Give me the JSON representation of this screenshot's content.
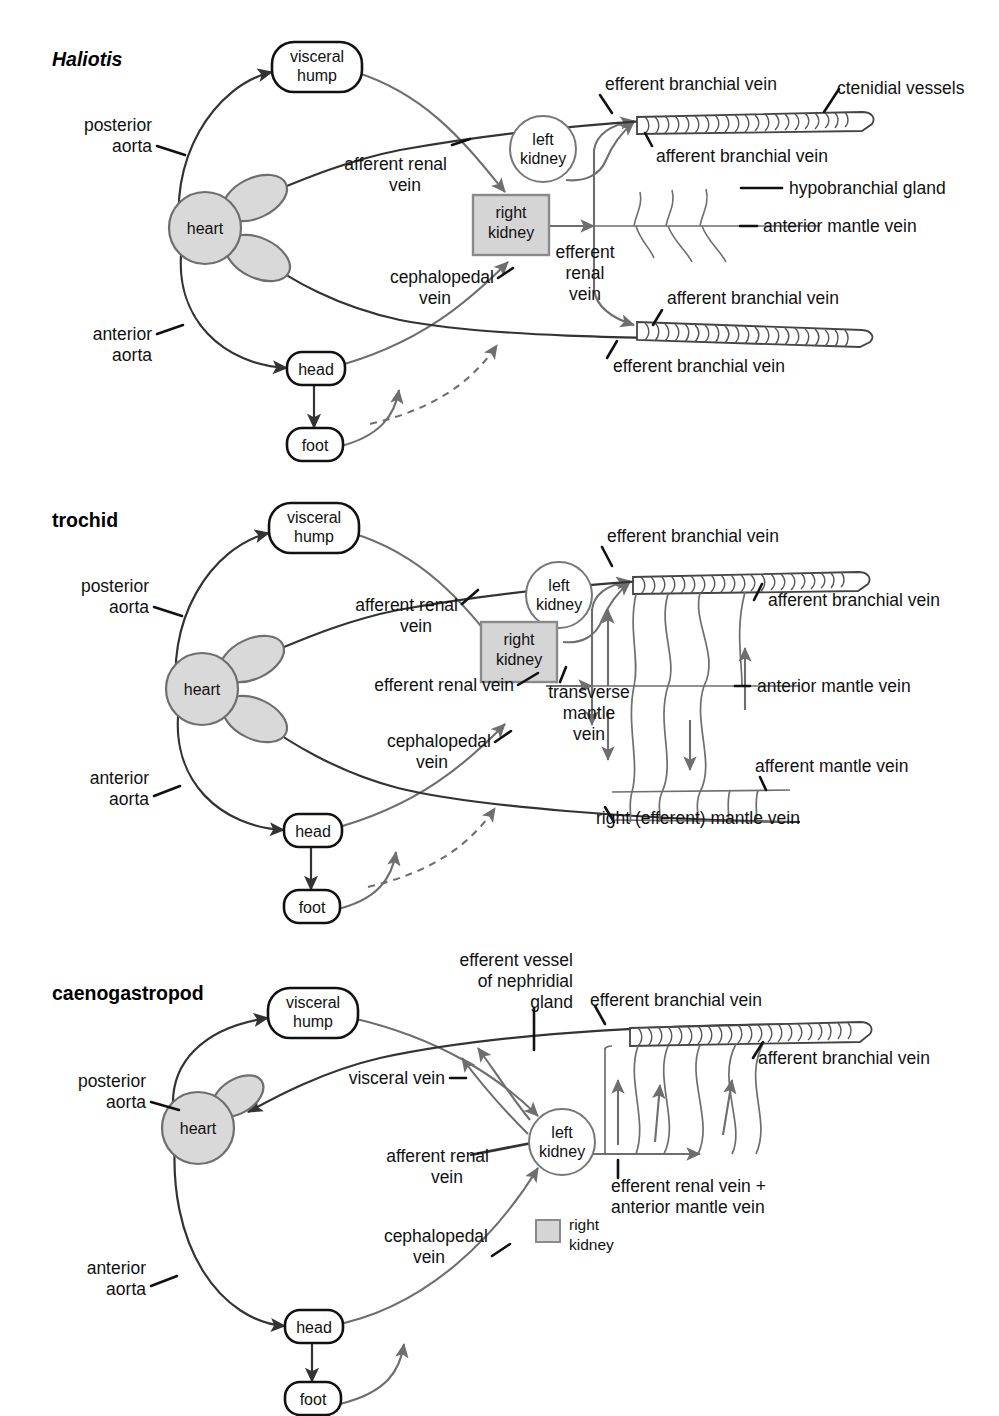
{
  "figure": {
    "kind": "comparative-anatomy-diagram",
    "background_color": "#ffffff",
    "ink_color": "#333333",
    "vessel_color": "#6e6e6e",
    "organ_fill": "#d9d9d9",
    "box_fill": "#d5d5d5"
  },
  "panels": [
    {
      "id": "haliotis",
      "title": "Haliotis",
      "title_italic": true,
      "nodes": [
        {
          "name": "visceral-hump",
          "label_line1": "visceral",
          "label_line2": "hump",
          "shape": "rounded-rect"
        },
        {
          "name": "heart",
          "label": "heart",
          "shape": "heart-two-auricles"
        },
        {
          "name": "head",
          "label": "head",
          "shape": "rounded-rect"
        },
        {
          "name": "foot",
          "label": "foot",
          "shape": "rounded-rect"
        },
        {
          "name": "left-kidney",
          "label_line1": "left",
          "label_line2": "kidney",
          "shape": "circle"
        },
        {
          "name": "right-kidney",
          "label_line1": "right",
          "label_line2": "kidney",
          "shape": "shaded-square"
        }
      ],
      "labels": [
        {
          "name": "posterior-aorta",
          "line1": "posterior",
          "line2": "aorta"
        },
        {
          "name": "anterior-aorta",
          "line1": "anterior",
          "line2": "aorta"
        },
        {
          "name": "afferent-renal-vein",
          "line1": "afferent renal",
          "line2": "vein"
        },
        {
          "name": "cephalopedal-vein",
          "line1": "cephalopedal",
          "line2": "vein"
        },
        {
          "name": "efferent-renal-vein",
          "line1": "efferent",
          "line2": "renal",
          "line3": "vein"
        },
        {
          "name": "efferent-branchial-vein-top",
          "line1": "efferent branchial vein"
        },
        {
          "name": "efferent-branchial-vein-bottom",
          "line1": "efferent branchial vein"
        },
        {
          "name": "afferent-branchial-vein-top",
          "line1": "afferent branchial vein"
        },
        {
          "name": "afferent-branchial-vein-bottom",
          "line1": "afferent branchial vein"
        },
        {
          "name": "ctenidial-vessels",
          "line1": "ctenidial vessels"
        },
        {
          "name": "hypobranchial-gland",
          "line1": "hypobranchial gland"
        },
        {
          "name": "anterior-mantle-vein",
          "line1": "anterior mantle vein"
        }
      ]
    },
    {
      "id": "trochid",
      "title": "trochid",
      "title_italic": false,
      "nodes": [
        {
          "name": "visceral-hump",
          "label_line1": "visceral",
          "label_line2": "hump",
          "shape": "rounded-rect"
        },
        {
          "name": "heart",
          "label": "heart",
          "shape": "heart-two-auricles"
        },
        {
          "name": "head",
          "label": "head",
          "shape": "rounded-rect"
        },
        {
          "name": "foot",
          "label": "foot",
          "shape": "rounded-rect"
        },
        {
          "name": "left-kidney",
          "label_line1": "left",
          "label_line2": "kidney",
          "shape": "circle"
        },
        {
          "name": "right-kidney",
          "label_line1": "right",
          "label_line2": "kidney",
          "shape": "shaded-square"
        }
      ],
      "labels": [
        {
          "name": "posterior-aorta",
          "line1": "posterior",
          "line2": "aorta"
        },
        {
          "name": "anterior-aorta",
          "line1": "anterior",
          "line2": "aorta"
        },
        {
          "name": "afferent-renal-vein",
          "line1": "afferent renal",
          "line2": "vein"
        },
        {
          "name": "efferent-renal-vein",
          "line1": "efferent renal vein"
        },
        {
          "name": "cephalopedal-vein",
          "line1": "cephalopedal",
          "line2": "vein"
        },
        {
          "name": "transverse-mantle-vein",
          "line1": "transverse",
          "line2": "mantle",
          "line3": "vein"
        },
        {
          "name": "efferent-branchial-vein",
          "line1": "efferent branchial vein"
        },
        {
          "name": "afferent-branchial-vein",
          "line1": "afferent branchial vein"
        },
        {
          "name": "anterior-mantle-vein",
          "line1": "anterior mantle vein"
        },
        {
          "name": "afferent-mantle-vein",
          "line1": "afferent mantle vein"
        },
        {
          "name": "right-efferent-mantle-vein",
          "line1": "right (efferent) mantle vein"
        }
      ]
    },
    {
      "id": "caenogastropod",
      "title": "caenogastropod",
      "title_italic": false,
      "nodes": [
        {
          "name": "visceral-hump",
          "label_line1": "visceral",
          "label_line2": "hump",
          "shape": "rounded-rect"
        },
        {
          "name": "heart",
          "label": "heart",
          "shape": "heart-one-auricle"
        },
        {
          "name": "head",
          "label": "head",
          "shape": "rounded-rect"
        },
        {
          "name": "foot",
          "label": "foot",
          "shape": "rounded-rect"
        },
        {
          "name": "left-kidney",
          "label_line1": "left",
          "label_line2": "kidney",
          "shape": "circle"
        }
      ],
      "labels": [
        {
          "name": "posterior-aorta",
          "line1": "posterior",
          "line2": "aorta"
        },
        {
          "name": "anterior-aorta",
          "line1": "anterior",
          "line2": "aorta"
        },
        {
          "name": "efferent-vessel-of-nephridial-gland",
          "line1": "efferent vessel",
          "line2": "of nephridial",
          "line3": "gland"
        },
        {
          "name": "visceral-vein",
          "line1": "visceral vein"
        },
        {
          "name": "afferent-renal-vein",
          "line1": "afferent renal",
          "line2": "vein"
        },
        {
          "name": "cephalopedal-vein",
          "line1": "cephalopedal",
          "line2": "vein"
        },
        {
          "name": "efferent-branchial-vein",
          "line1": "efferent branchial vein"
        },
        {
          "name": "afferent-branchial-vein",
          "line1": "afferent branchial vein"
        },
        {
          "name": "efferent-renal-plus-anterior-mantle-vein",
          "line1": "efferent renal vein +",
          "line2": "anterior mantle vein"
        }
      ],
      "legend": {
        "name": "right-kidney-legend",
        "swatch_color": "#d5d5d5",
        "line1": "right",
        "line2": "kidney"
      }
    }
  ]
}
